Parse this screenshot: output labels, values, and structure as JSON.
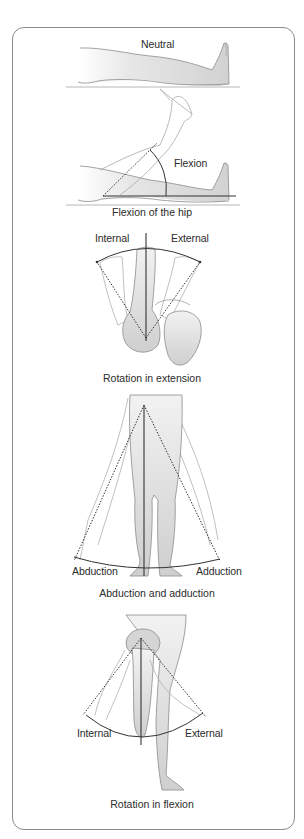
{
  "figure": {
    "panels": [
      {
        "id": "flexion",
        "labels": {
          "neutral": "Neutral",
          "flexion": "Flexion"
        },
        "caption": "Flexion of the hip"
      },
      {
        "id": "rotation-extension",
        "labels": {
          "internal": "Internal",
          "external": "External"
        },
        "caption": "Rotation in extension"
      },
      {
        "id": "abduction-adduction",
        "labels": {
          "abduction": "Abduction",
          "adduction": "Adduction"
        },
        "caption": "Abduction and adduction"
      },
      {
        "id": "rotation-flexion",
        "labels": {
          "internal": "Internal",
          "external": "External"
        },
        "caption": "Rotation in flexion"
      }
    ],
    "colors": {
      "frame": "#8a8a8a",
      "limb_fill": "#d9d9d9",
      "limb_stroke": "#8c8c8c",
      "ghost_stroke": "#a8a8a8",
      "axis_line": "#333333"
    }
  }
}
